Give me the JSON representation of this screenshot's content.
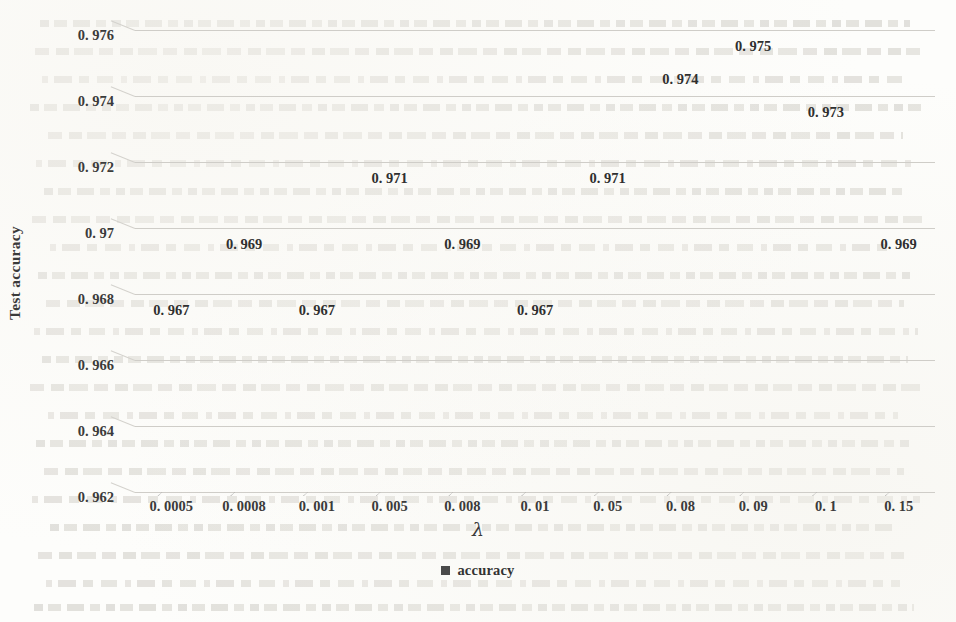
{
  "chart_data": {
    "type": "bar",
    "title": "",
    "subtitle": "",
    "xlabel": "λ",
    "ylabel": "Test accuracy",
    "categories": [
      "0. 0005",
      "0. 0008",
      "0. 001",
      "0. 005",
      "0. 008",
      "0. 01",
      "0. 05",
      "0. 08",
      "0. 09",
      "0. 1",
      "0. 15"
    ],
    "values": [
      0.967,
      0.969,
      0.967,
      0.971,
      0.969,
      0.967,
      0.971,
      0.974,
      0.975,
      0.973,
      0.969
    ],
    "data_labels": [
      "0. 967",
      "0. 969",
      "0. 967",
      "0. 971",
      "0. 969",
      "0. 967",
      "0. 971",
      "0. 974",
      "0. 975",
      "0. 973",
      "0. 969"
    ],
    "series": [
      {
        "name": "accuracy",
        "values": [
          0.967,
          0.969,
          0.967,
          0.971,
          0.969,
          0.967,
          0.971,
          0.974,
          0.975,
          0.973,
          0.969
        ]
      }
    ],
    "ylim": [
      0.962,
      0.976
    ],
    "yticks": [
      0.962,
      0.964,
      0.966,
      0.968,
      0.97,
      0.972,
      0.974,
      0.976
    ],
    "ytick_labels": [
      "0. 962",
      "0. 964",
      "0. 966",
      "0. 968",
      "0. 97",
      "0. 972",
      "0. 974",
      "0. 976"
    ],
    "grid": true,
    "grid_axis": "y",
    "legend": {
      "position": "bottom-center",
      "entries": [
        {
          "label": "accuracy",
          "color": "#4a4a4a",
          "marker": "square"
        }
      ]
    },
    "style": {
      "bar_color": "#4a4a4a",
      "bar_highlight_color": "#5e5e5e",
      "gridline_color": "#cfcdc8",
      "text_color": "#3b3b3b",
      "background": "#fdfdfb",
      "bar_3d": true
    }
  }
}
